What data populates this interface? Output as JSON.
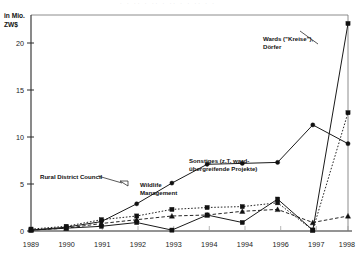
{
  "chart_data": {
    "type": "line",
    "title": "",
    "xlabel": "",
    "ylabel": "in Mio. ZW$",
    "ylabel_line1": "in Mio.",
    "ylabel_line2": "ZW$",
    "ylim": [
      0,
      23
    ],
    "yticks": [
      0,
      5,
      10,
      15,
      20
    ],
    "ytick_labels": [
      "0",
      "5",
      "10",
      "15",
      "20"
    ],
    "grid": false,
    "legend_position": "inline-annotations",
    "categories": [
      "1989",
      "1990",
      "1991",
      "1992",
      "1993",
      "1994",
      "1994",
      "1996",
      "1997",
      "1998"
    ],
    "series": [
      {
        "name": "Wards (\"Kreise\"), Dörfer",
        "marker": "square",
        "linestyle": "solid",
        "values": [
          0.1,
          0.3,
          0.5,
          0.9,
          0.1,
          1.7,
          0.9,
          3.4,
          0.1,
          22.1
        ]
      },
      {
        "name": "Sonstiges (z.T. ward-übergreifende Projekte)",
        "marker": "circle",
        "linestyle": "solid",
        "values": [
          0.1,
          0.4,
          1.0,
          2.9,
          5.1,
          7.1,
          7.2,
          7.3,
          11.3,
          9.3
        ]
      },
      {
        "name": "Wildlife Management",
        "marker": "square",
        "linestyle": "dotted",
        "values": [
          0.2,
          0.5,
          1.2,
          1.6,
          2.3,
          2.5,
          2.6,
          3.0,
          0.1,
          12.6
        ]
      },
      {
        "name": "Rural District Council",
        "marker": "triangle",
        "linestyle": "dashed",
        "values": [
          0.1,
          0.3,
          0.8,
          1.2,
          1.6,
          1.7,
          2.1,
          2.3,
          0.9,
          1.6
        ]
      }
    ],
    "annotations": [
      {
        "id": "wards",
        "text_line1": "Wards (\"Kreise\"),",
        "text_line2": "Dörfer"
      },
      {
        "id": "sonstiges",
        "text_line1": "Sonstiges (z.T. ward-",
        "text_line2": "übergreifende Projekte)"
      },
      {
        "id": "wildlife",
        "text_line1": "Wildlife",
        "text_line2": "Management"
      },
      {
        "id": "rdc",
        "text_line1": "Rural District Council",
        "text_line2": ""
      }
    ]
  },
  "scan": {
    "artifact_text": "· ·  ·· ·   ·· ·  ·· ·   · ·· ·  ·"
  },
  "colors": {
    "ink": "#1a1a1a",
    "frame": "#6e6e6e",
    "paper": "#ffffff"
  }
}
